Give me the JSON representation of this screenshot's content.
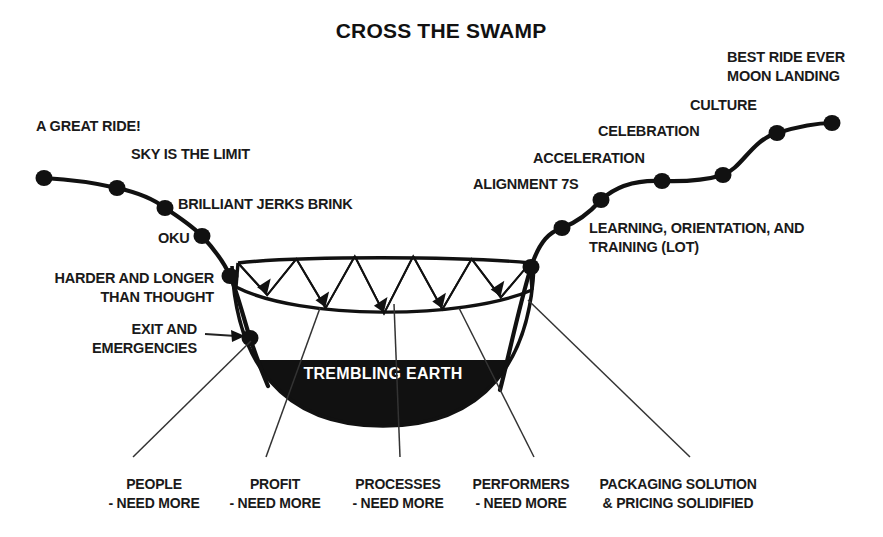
{
  "title": "CROSS THE SWAMP",
  "earth": {
    "label": "TREMBLING EARTH"
  },
  "colors": {
    "ink": "#111111",
    "background": "#ffffff",
    "earth_fill": "#111111",
    "earth_text": "#ffffff",
    "leader_line": "#333333"
  },
  "milestones": [
    {
      "id": "a-great-ride",
      "label": "A GREAT RIDE!",
      "x": 44,
      "y": 178,
      "label_x": 36,
      "label_y": 131,
      "anchor": "start",
      "lines": [
        "A GREAT RIDE!"
      ]
    },
    {
      "id": "sky-is-the-limit",
      "label": "SKY IS THE LIMIT",
      "x": 117,
      "y": 188,
      "label_x": 131,
      "label_y": 159,
      "anchor": "start",
      "lines": [
        "SKY IS THE LIMIT"
      ]
    },
    {
      "id": "brilliant-jerks",
      "label": "BRILLIANT JERKS BRINK",
      "x": 165,
      "y": 208,
      "label_x": 178,
      "label_y": 209,
      "anchor": "start",
      "lines": [
        "BRILLIANT JERKS BRINK"
      ]
    },
    {
      "id": "oku",
      "label": "OKU",
      "x": 202,
      "y": 236,
      "label_x": 158,
      "label_y": 243,
      "anchor": "start",
      "lines": [
        "OKU"
      ]
    },
    {
      "id": "harder-and-longer",
      "label": "HARDER AND LONGER THAN THOUGHT",
      "x": 230,
      "y": 276,
      "label_x": 214,
      "label_y": 283,
      "anchor": "end",
      "lines": [
        "HARDER AND LONGER",
        "THAN THOUGHT"
      ]
    },
    {
      "id": "exit-emergencies",
      "label": "EXIT AND EMERGENCIES",
      "x": 250,
      "y": 338,
      "label_x": 197,
      "label_y": 334,
      "anchor": "end",
      "lines": [
        "EXIT AND",
        "EMERGENCIES"
      ]
    },
    {
      "id": "learning-lot",
      "label": "LEARNING, ORIENTATION, AND TRAINING (LOT)",
      "x": 531,
      "y": 267,
      "label_x": 589,
      "label_y": 233,
      "anchor": "start",
      "lines": [
        "LEARNING, ORIENTATION, AND",
        "TRAINING (LOT)"
      ]
    },
    {
      "id": "alignment-7s",
      "label": "ALIGNMENT 7S",
      "x": 562,
      "y": 228,
      "label_x": 473,
      "label_y": 189,
      "anchor": "start",
      "lines": [
        "ALIGNMENT 7S"
      ]
    },
    {
      "id": "acceleration",
      "label": "ACCELERATION",
      "x": 601,
      "y": 200,
      "label_x": 533,
      "label_y": 163,
      "anchor": "start",
      "lines": [
        "ACCELERATION"
      ]
    },
    {
      "id": "celebration",
      "label": "CELEBRATION",
      "x": 662,
      "y": 181,
      "label_x": 598,
      "label_y": 136,
      "anchor": "start",
      "lines": [
        "CELEBRATION"
      ]
    },
    {
      "id": "culture",
      "label": "CULTURE",
      "x": 723,
      "y": 175,
      "label_x": 690,
      "label_y": 110,
      "anchor": "start",
      "lines": [
        "CULTURE"
      ]
    },
    {
      "id": "moon-landing",
      "label": "BEST RIDE EVER MOON LANDING",
      "x": 777,
      "y": 133,
      "label_x": 727,
      "label_y": 62,
      "anchor": "start",
      "lines": [
        "BEST RIDE EVER",
        "MOON LANDING"
      ]
    },
    {
      "id": "best-ride-ever-end",
      "label": "",
      "x": 832,
      "y": 123,
      "label_x": 0,
      "label_y": 0,
      "anchor": "start",
      "lines": []
    }
  ],
  "bottom_labels": [
    {
      "id": "people",
      "lines": [
        "PEOPLE",
        "- NEED MORE"
      ],
      "x": 154,
      "y": 489,
      "anchor": "middle",
      "leader_from_x": 251,
      "leader_from_y": 341,
      "leader_to_x": 133,
      "leader_to_y": 457
    },
    {
      "id": "profit",
      "lines": [
        "PROFIT",
        "- NEED MORE"
      ],
      "x": 275,
      "y": 489,
      "anchor": "middle",
      "leader_from_x": 320,
      "leader_from_y": 308,
      "leader_to_x": 266,
      "leader_to_y": 457
    },
    {
      "id": "processes",
      "lines": [
        "PROCESSES",
        "- NEED MORE"
      ],
      "x": 398,
      "y": 489,
      "anchor": "middle",
      "leader_from_x": 394,
      "leader_from_y": 304,
      "leader_to_x": 400,
      "leader_to_y": 457
    },
    {
      "id": "performers",
      "lines": [
        "PERFORMERS",
        "- NEED MORE"
      ],
      "x": 521,
      "y": 489,
      "anchor": "middle",
      "leader_from_x": 459,
      "leader_from_y": 308,
      "leader_to_x": 534,
      "leader_to_y": 457
    },
    {
      "id": "packaging",
      "lines": [
        "PACKAGING SOLUTION",
        "& PRICING SOLIDIFIED"
      ],
      "x": 678,
      "y": 489,
      "anchor": "middle",
      "leader_from_x": 528,
      "leader_from_y": 300,
      "leader_to_x": 690,
      "leader_to_y": 457
    }
  ],
  "swamp_band": {
    "segments": 5,
    "arrow_count": 5,
    "description": "zigzag band"
  },
  "pointer": {
    "id": "exit-pointer",
    "from_x": 205,
    "from_y": 334,
    "to_x": 243,
    "to_y": 336
  }
}
